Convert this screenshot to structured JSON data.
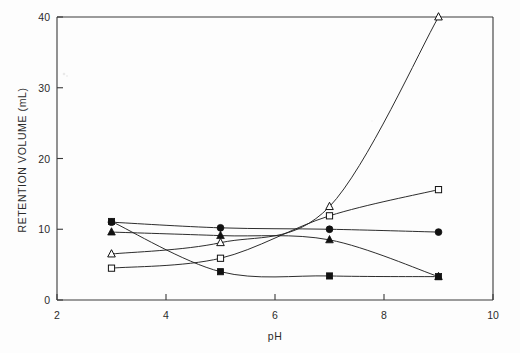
{
  "chart_data": {
    "type": "line",
    "title": "",
    "xlabel": "pH",
    "ylabel": "RETENTION VOLUME (mL)",
    "xlim": [
      2,
      10
    ],
    "ylim": [
      0,
      40
    ],
    "xticks": [
      2,
      4,
      6,
      8,
      10
    ],
    "yticks": [
      0,
      10,
      20,
      30,
      40
    ],
    "xtick_labels": [
      "2",
      "4",
      "6",
      "8",
      "10"
    ],
    "ytick_labels": [
      "0",
      "10",
      "20",
      "30",
      "40"
    ],
    "grid": false,
    "legend": "none",
    "x": [
      3,
      5,
      7,
      9
    ],
    "series": [
      {
        "name": "open-triangle",
        "marker": "triangle-open",
        "values": [
          6.5,
          8.1,
          13.2,
          40.0
        ]
      },
      {
        "name": "open-square",
        "marker": "square-open",
        "values": [
          4.5,
          5.9,
          11.9,
          15.6
        ]
      },
      {
        "name": "filled-circle",
        "marker": "circle-filled",
        "values": [
          11.0,
          10.2,
          10.0,
          9.6
        ]
      },
      {
        "name": "filled-triangle",
        "marker": "triangle-filled",
        "values": [
          9.6,
          9.1,
          8.5,
          3.3
        ]
      },
      {
        "name": "filled-square",
        "marker": "square-filled",
        "values": [
          11.1,
          4.0,
          3.4,
          3.3
        ]
      }
    ]
  },
  "axes": {
    "x_title": "pH",
    "y_title": "RETENTION VOLUME (mL)",
    "x_tick_0": "2",
    "x_tick_1": "4",
    "x_tick_2": "6",
    "x_tick_3": "8",
    "x_tick_4": "10",
    "y_tick_0": "0",
    "y_tick_1": "10",
    "y_tick_2": "20",
    "y_tick_3": "30",
    "y_tick_4": "40"
  },
  "colors": {
    "ink": "#222222",
    "frame": "#3a3a3a",
    "background": "#fdfdfd"
  }
}
